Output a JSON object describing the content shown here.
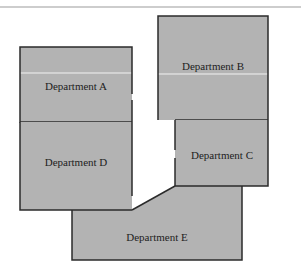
{
  "diagram": {
    "type": "floor-plan",
    "colors": {
      "fill": "#b3b3b3",
      "stroke": "#2b2b2b",
      "top_rule": "#bdbdbd",
      "highlight_line": "#f2f2f2",
      "background": "#ffffff"
    },
    "departments": [
      {
        "id": "A",
        "label": "Department A"
      },
      {
        "id": "B",
        "label": "Department B"
      },
      {
        "id": "C",
        "label": "Department C"
      },
      {
        "id": "D",
        "label": "Department D"
      },
      {
        "id": "E",
        "label": "Department E"
      }
    ]
  }
}
